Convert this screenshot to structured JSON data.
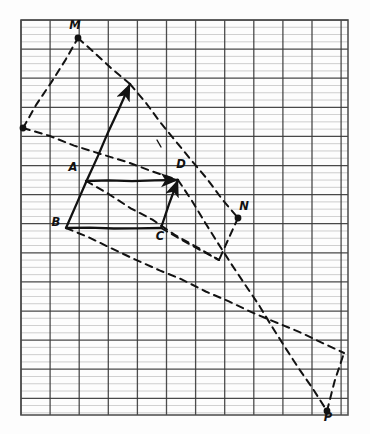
{
  "figure": {
    "kind": "hand-drawn-geometry-diagram",
    "medium": "lined graph paper",
    "title": "",
    "paper": {
      "background": "#fdfdfd",
      "minor_line_color": "#9a9a9a",
      "major_line_color": "#3a3a3a",
      "border_color": "#4a4a4a",
      "left": 21,
      "top": 20,
      "right": 348,
      "bottom": 415,
      "vertical_spacing": 29.1,
      "horizontal_major_spacing": 29.1,
      "horizontal_minor_per_major": 4
    },
    "ink_color": "#121212",
    "points": [
      {
        "name": "M",
        "label": "M",
        "x": 78,
        "y": 38,
        "dot": true,
        "label_dx": -3,
        "label_dy": -9
      },
      {
        "name": "A",
        "label": "A",
        "x": 86,
        "y": 181,
        "dot": false,
        "label_dx": -13,
        "label_dy": -10
      },
      {
        "name": "B",
        "label": "B",
        "x": 66,
        "y": 228,
        "dot": false,
        "label_dx": -10,
        "label_dy": -2
      },
      {
        "name": "C",
        "label": "C",
        "x": 161,
        "y": 228,
        "dot": false,
        "label_dx": -1,
        "label_dy": 12
      },
      {
        "name": "D",
        "label": "D",
        "x": 178,
        "y": 180,
        "dot": false,
        "label_dx": 3,
        "label_dy": -12
      },
      {
        "name": "N",
        "label": "N",
        "x": 238,
        "y": 218,
        "dot": true,
        "label_dx": 6,
        "label_dy": -8
      },
      {
        "name": "P",
        "label": "P",
        "x": 327,
        "y": 411,
        "dot": true,
        "label_dx": 1,
        "label_dy": 10
      },
      {
        "name": "E",
        "label": "",
        "x": 23,
        "y": 128,
        "dot": true,
        "label_dx": 0,
        "label_dy": 0
      },
      {
        "name": "F",
        "label": "",
        "x": 130,
        "y": 84,
        "dot": false,
        "label_dx": 0,
        "label_dy": 0
      },
      {
        "name": "G",
        "label": "",
        "x": 219,
        "y": 260,
        "dot": false,
        "label_dx": 0,
        "label_dy": 0
      },
      {
        "name": "H",
        "label": "",
        "x": 344,
        "y": 353,
        "dot": false,
        "label_dx": 0,
        "label_dy": 0
      }
    ],
    "solid_segments": [
      {
        "name": "segment-B-to-F",
        "from": [
          66,
          228
        ],
        "to": [
          130,
          84
        ],
        "arrow": true
      },
      {
        "name": "segment-A-to-D",
        "from": [
          86,
          181
        ],
        "to": [
          178,
          180
        ],
        "arrow": true
      },
      {
        "name": "segment-B-to-C",
        "from": [
          66,
          228
        ],
        "to": [
          161,
          228
        ],
        "arrow": false
      },
      {
        "name": "segment-C-to-D",
        "from": [
          161,
          228
        ],
        "to": [
          178,
          180
        ],
        "arrow": true
      }
    ],
    "dashed_segments": [
      {
        "name": "dashed-E-to-M",
        "from": [
          23,
          128
        ],
        "to": [
          78,
          38
        ]
      },
      {
        "name": "dashed-M-to-F",
        "from": [
          78,
          38
        ],
        "to": [
          130,
          84
        ]
      },
      {
        "name": "dashed-E-to-D",
        "from": [
          23,
          128
        ],
        "to": [
          178,
          180
        ]
      },
      {
        "name": "dashed-F-to-N",
        "from": [
          130,
          84
        ],
        "to": [
          238,
          218
        ]
      },
      {
        "name": "dashed-A-to-G",
        "from": [
          86,
          181
        ],
        "to": [
          219,
          260
        ]
      },
      {
        "name": "dashed-N-to-G",
        "from": [
          238,
          218
        ],
        "to": [
          219,
          260
        ]
      },
      {
        "name": "dashed-B-to-H",
        "from": [
          66,
          228
        ],
        "to": [
          344,
          353
        ]
      },
      {
        "name": "dashed-D-to-P",
        "from": [
          178,
          180
        ],
        "to": [
          327,
          411
        ]
      },
      {
        "name": "dashed-P-to-H",
        "from": [
          327,
          411
        ],
        "to": [
          344,
          353
        ]
      },
      {
        "name": "dashed-C-to-long",
        "from": [
          161,
          228
        ],
        "to": [
          219,
          260
        ]
      }
    ],
    "tick_marks": [
      {
        "name": "tick-mark-upper",
        "x": 157,
        "y": 140
      }
    ]
  }
}
